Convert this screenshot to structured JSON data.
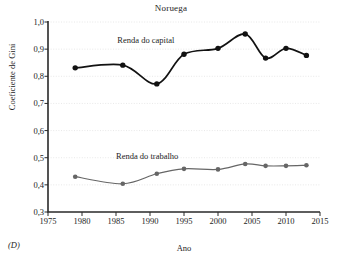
{
  "figure": {
    "panel_letter": "(D)"
  },
  "chart_data": {
    "type": "line",
    "title": "Noruega",
    "xlabel": "Ano",
    "ylabel": "Coeficiente de Gini",
    "xlim": [
      1975,
      2015
    ],
    "ylim": [
      0.3,
      1.0
    ],
    "xticks": [
      "1975",
      "1980",
      "1985",
      "1990",
      "1995",
      "2000",
      "2005",
      "2010",
      "2015"
    ],
    "xtick_values": [
      1975,
      1980,
      1985,
      1990,
      1995,
      2000,
      2005,
      2010,
      2015
    ],
    "yticks": [
      "0,3",
      "0,4",
      "0,5",
      "0,6",
      "0,7",
      "0,8",
      "0,9",
      "1,0"
    ],
    "ytick_values": [
      0.3,
      0.4,
      0.5,
      0.6,
      0.7,
      0.8,
      0.9,
      1.0
    ],
    "grid": true,
    "grid_axis": "y",
    "legend": "inline-annotations",
    "x": [
      1979,
      1986,
      1991,
      1995,
      2000,
      2004,
      2007,
      2010,
      2013
    ],
    "series": [
      {
        "name": "Renda do capital",
        "color": "#121212",
        "marker": "circle",
        "label_x": 1985.2,
        "label_y": 0.932,
        "values": [
          0.831,
          0.841,
          0.772,
          0.881,
          0.903,
          0.956,
          0.867,
          0.903,
          0.877
        ]
      },
      {
        "name": "Renda do trabalho",
        "color": "#666666",
        "marker": "circle",
        "label_x": 1985.0,
        "label_y": 0.505,
        "values": [
          0.43,
          0.404,
          0.441,
          0.459,
          0.457,
          0.477,
          0.47,
          0.47,
          0.472
        ]
      }
    ]
  }
}
